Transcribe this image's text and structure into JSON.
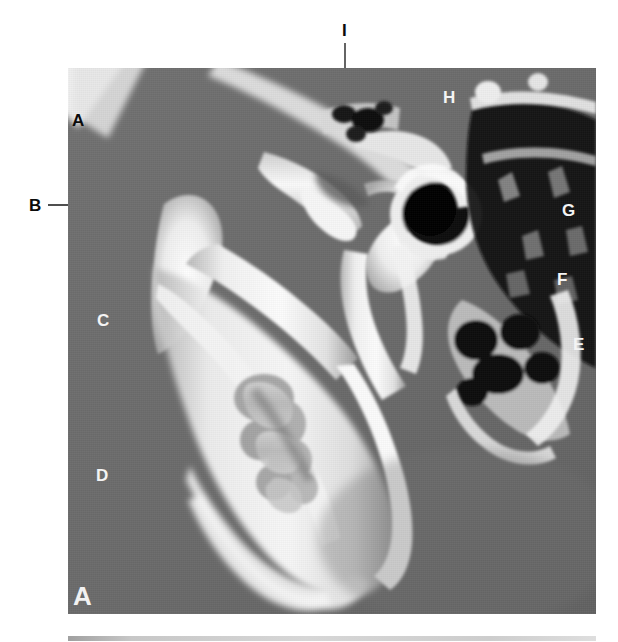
{
  "figure": {
    "panel_id": "A",
    "modality": "cbct-sagittal-tmj",
    "image_region": {
      "x": 68,
      "y": 68,
      "width": 528,
      "height": 546
    },
    "background_color": "#ffffff",
    "soft_tissue_color": "#6d6d6d",
    "bone_color": "#f2f2f2",
    "air_color": "#080808"
  },
  "labels": [
    {
      "id": "A",
      "text": "A",
      "tone": "dark",
      "x": 72,
      "y": 112
    },
    {
      "id": "B",
      "text": "B",
      "tone": "dark",
      "x": 29,
      "y": 197
    },
    {
      "id": "C",
      "text": "C",
      "tone": "light",
      "x": 97,
      "y": 312
    },
    {
      "id": "D",
      "text": "D",
      "tone": "light",
      "x": 96,
      "y": 467
    },
    {
      "id": "E",
      "text": "E",
      "tone": "light",
      "x": 573,
      "y": 336
    },
    {
      "id": "F",
      "text": "F",
      "tone": "light",
      "x": 557,
      "y": 271
    },
    {
      "id": "G",
      "text": "G",
      "tone": "light",
      "x": 562,
      "y": 202
    },
    {
      "id": "H",
      "text": "H",
      "tone": "light",
      "x": 443,
      "y": 89
    },
    {
      "id": "I",
      "text": "I",
      "tone": "dark",
      "x": 342,
      "y": 22
    }
  ],
  "leader_lines": [
    {
      "for": "A",
      "stroke": "#111111",
      "points": "86,120 284,181"
    },
    {
      "for": "A2",
      "stroke": "#111111",
      "points": "86,118 281,175"
    },
    {
      "for": "B",
      "stroke": "#141414",
      "points": "48,205 152,205"
    },
    {
      "for": "C",
      "stroke": "#151515",
      "points": "114,320 292,320"
    },
    {
      "for": "D",
      "stroke": "#151515",
      "points": "112,475 276,475"
    },
    {
      "for": "E",
      "stroke": "#e9e9e9",
      "points": "452,343 567,343"
    },
    {
      "for": "F",
      "stroke": "#e9e9e9",
      "points": "334,278 551,278"
    },
    {
      "for": "G",
      "stroke": "#cfcfcf",
      "points": "425,209 556,209"
    },
    {
      "for": "H",
      "stroke": "#ededed",
      "points": "438,101 366,192"
    },
    {
      "for": "I",
      "stroke": "#111111",
      "points": "345,43 345,172"
    }
  ],
  "panel_label": {
    "text": "A",
    "x": 73,
    "y": 583
  }
}
